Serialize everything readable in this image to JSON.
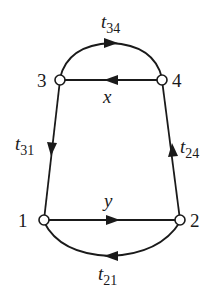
{
  "diagram": {
    "type": "signal-flow-graph",
    "nodes": [
      {
        "id": "1",
        "label": "1"
      },
      {
        "id": "2",
        "label": "2"
      },
      {
        "id": "3",
        "label": "3"
      },
      {
        "id": "4",
        "label": "4"
      }
    ],
    "edges": [
      {
        "from": "3",
        "to": "4",
        "label_main": "t",
        "label_sub": "34",
        "shape": "arc-top"
      },
      {
        "from": "4",
        "to": "3",
        "label_main": "x",
        "label_sub": "",
        "shape": "straight"
      },
      {
        "from": "3",
        "to": "1",
        "label_main": "t",
        "label_sub": "31",
        "shape": "straight"
      },
      {
        "from": "2",
        "to": "4",
        "label_main": "t",
        "label_sub": "24",
        "shape": "straight"
      },
      {
        "from": "1",
        "to": "2",
        "label_main": "y",
        "label_sub": "",
        "shape": "straight"
      },
      {
        "from": "2",
        "to": "1",
        "label_main": "t",
        "label_sub": "21",
        "shape": "arc-bottom"
      }
    ],
    "colors": {
      "stroke": "#1a1a1a",
      "node_fill": "#ffffff",
      "background": "#ffffff"
    }
  }
}
